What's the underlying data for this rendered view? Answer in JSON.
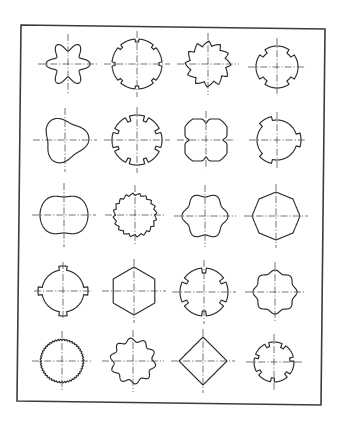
{
  "figure": {
    "caption": "Spline and profile shaft cross-sections, 5 rows × 4 columns",
    "stroke_color": "#2a2a2a",
    "frame": {
      "tl": [
        21,
        25
      ],
      "tr": [
        325,
        29
      ],
      "br": [
        321,
        405
      ],
      "bl": [
        17,
        401
      ]
    },
    "shapes": [
      {
        "id": "r1c1",
        "name": "six-point-star-profile",
        "cx": 68,
        "cy": 64,
        "type": "lobes",
        "n": 6,
        "r": 22,
        "depth": 9,
        "phase": 0
      },
      {
        "id": "r1c2",
        "name": "eight-groove-round-shaft",
        "cx": 137,
        "cy": 64,
        "type": "notch",
        "n": 8,
        "r": 25,
        "depth": 3,
        "width": 0.18,
        "phase": 0
      },
      {
        "id": "r1c3",
        "name": "sawtooth-spline",
        "cx": 208,
        "cy": 64,
        "type": "saw",
        "n": 12,
        "r": 23,
        "depth": 5,
        "phase": 0.2
      },
      {
        "id": "r1c4",
        "name": "four-notch-round-shaft",
        "cx": 277,
        "cy": 67,
        "type": "notch",
        "n": 4,
        "r": 21,
        "depth": 4,
        "width": 0.22,
        "phase": 0.785
      },
      {
        "id": "r2c1",
        "name": "tri-lobe-cam-profile",
        "cx": 65,
        "cy": 140,
        "type": "trilobe",
        "r": 24,
        "phase": -0.1
      },
      {
        "id": "r2c2",
        "name": "eight-slot-spline",
        "cx": 137,
        "cy": 140,
        "type": "slot",
        "n": 8,
        "r": 25,
        "depth": 5,
        "width": 0.2,
        "phase": 0
      },
      {
        "id": "r2c3",
        "name": "four-lobe-rounded-square",
        "cx": 206,
        "cy": 140,
        "type": "quad",
        "r": 21,
        "phase": 0
      },
      {
        "id": "r2c4",
        "name": "round-shaft-three-keys",
        "cx": 277,
        "cy": 140,
        "type": "keys",
        "n": 3,
        "r": 20,
        "depth": 4,
        "width": 0.28,
        "phase": 0
      },
      {
        "id": "r3c1",
        "name": "double-flat-barrel-profile",
        "cx": 64,
        "cy": 215,
        "type": "barrel",
        "r": 24,
        "depth": 6
      },
      {
        "id": "r3c2",
        "name": "fine-serration-shaft",
        "cx": 135,
        "cy": 215,
        "type": "saw",
        "n": 20,
        "r": 22,
        "depth": 2.5,
        "phase": 0
      },
      {
        "id": "r3c3",
        "name": "hexagonal-lobed-spline",
        "cx": 205,
        "cy": 216,
        "type": "lobes",
        "n": 6,
        "r": 23,
        "depth": 4,
        "phase": 0
      },
      {
        "id": "r3c4",
        "name": "octagonal-profile",
        "cx": 276,
        "cy": 216,
        "type": "poly",
        "n": 8,
        "r": 24,
        "phase": 0
      },
      {
        "id": "r4c1",
        "name": "round-shaft-four-lugs",
        "cx": 63,
        "cy": 291,
        "type": "keys",
        "n": 4,
        "r": 21,
        "depth": 4,
        "width": 0.22,
        "phase": 0
      },
      {
        "id": "r4c2",
        "name": "hexagon-profile",
        "cx": 134,
        "cy": 291,
        "type": "poly",
        "n": 6,
        "r": 24,
        "phase": 1.5708
      },
      {
        "id": "r4c3",
        "name": "six-slot-spline",
        "cx": 204,
        "cy": 292,
        "type": "slot",
        "n": 6,
        "r": 24,
        "depth": 5,
        "width": 0.18,
        "phase": 0
      },
      {
        "id": "r4c4",
        "name": "eight-lobe-flower-profile",
        "cx": 275,
        "cy": 292,
        "type": "lobes",
        "n": 8,
        "r": 22,
        "depth": 3,
        "phase": 0
      },
      {
        "id": "r5c1",
        "name": "fine-tooth-serrated-shaft",
        "cx": 62,
        "cy": 361,
        "type": "saw",
        "n": 48,
        "r": 22,
        "depth": 1.4,
        "phase": 0
      },
      {
        "id": "r5c2",
        "name": "ten-lobe-wavy-spline",
        "cx": 133,
        "cy": 361,
        "type": "lobes",
        "n": 10,
        "r": 23,
        "depth": 4,
        "phase": 0.2
      },
      {
        "id": "r5c3",
        "name": "rounded-diamond-profile",
        "cx": 203,
        "cy": 361,
        "type": "poly",
        "n": 4,
        "r": 24,
        "phase": 0
      },
      {
        "id": "r5c4",
        "name": "stepped-lobe-spline",
        "cx": 274,
        "cy": 362,
        "type": "slot",
        "n": 7,
        "r": 20,
        "depth": 4,
        "width": 0.22,
        "phase": 0.3
      }
    ]
  }
}
